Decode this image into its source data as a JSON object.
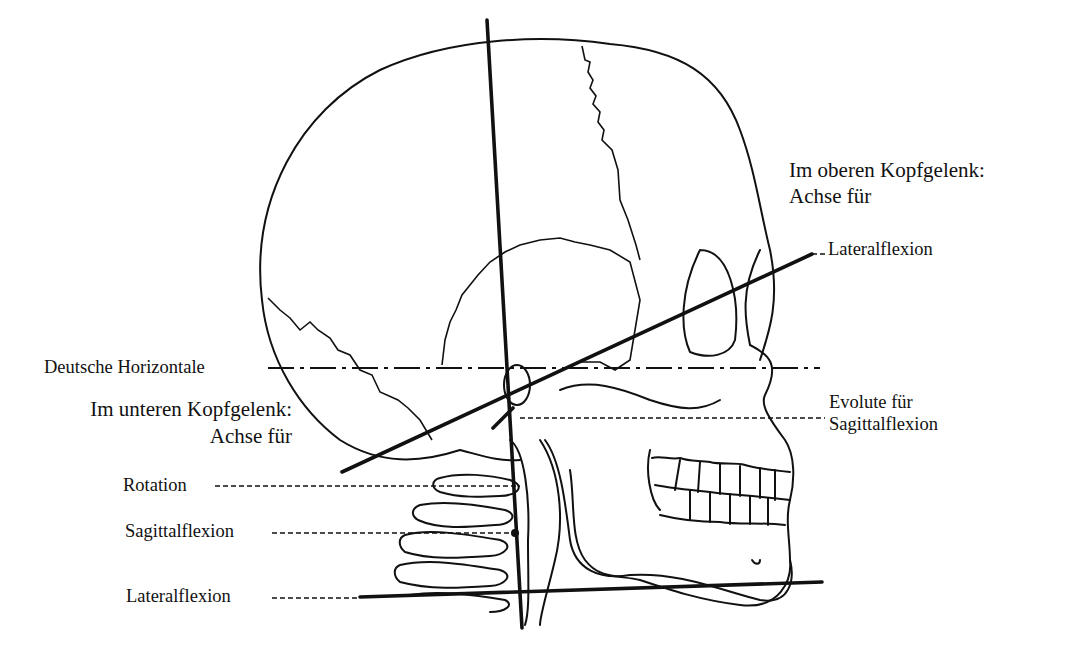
{
  "figure": {
    "colors": {
      "ink": "#111111",
      "background": "#ffffff"
    }
  },
  "labels": {
    "upper_joint": {
      "title": "Im oberen Kopfgelenk:",
      "subtitle": "Achse für",
      "axis": "Lateralflexion"
    },
    "german_horizontal": "Deutsche Horizontale",
    "lower_joint": {
      "title": "Im unteren Kopfgelenk:",
      "subtitle": "Achse für"
    },
    "evolute": {
      "line1": "Evolute für",
      "line2": "Sagittalflexion"
    },
    "lower_axes": {
      "rotation": "Rotation",
      "sagittal": "Sagittalflexion",
      "lateral": "Lateralflexion"
    }
  }
}
